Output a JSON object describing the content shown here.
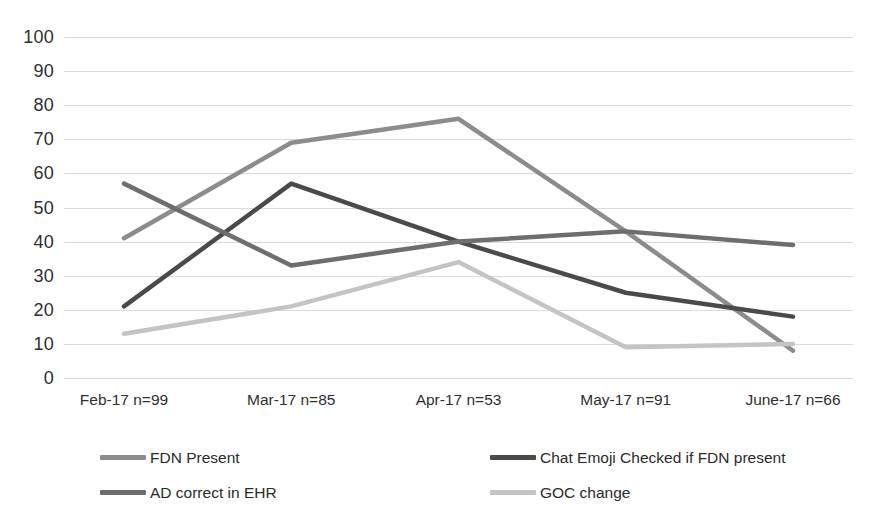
{
  "chart_data": {
    "type": "line",
    "title": "",
    "xlabel": "",
    "ylabel": "",
    "ylim": [
      0,
      100
    ],
    "ytick_step": 10,
    "grid": true,
    "legend_position": "bottom",
    "categories": [
      "Feb-17  n=99",
      "Mar-17  n=85",
      "Apr-17  n=53",
      "May-17 n=91",
      "June-17 n=66"
    ],
    "yticks": [
      "100",
      "90",
      "80",
      "70",
      "60",
      "50",
      "40",
      "30",
      "20",
      "10",
      "0"
    ],
    "ytick_values": [
      100,
      90,
      80,
      70,
      60,
      50,
      40,
      30,
      20,
      10,
      0
    ],
    "series": [
      {
        "name": "FDN Present",
        "color": "#8c8c8c",
        "values": [
          41,
          69,
          76,
          43,
          8
        ]
      },
      {
        "name": "Chat Emoji Checked if FDN present",
        "color": "#4a4a4a",
        "values": [
          21,
          57,
          40,
          25,
          18
        ]
      },
      {
        "name": "AD correct in EHR",
        "color": "#6e6e6e",
        "values": [
          57,
          33,
          40,
          43,
          39
        ]
      },
      {
        "name": "GOC change",
        "color": "#c4c4c4",
        "values": [
          13,
          21,
          34,
          9,
          10
        ]
      }
    ]
  },
  "legend": {
    "items": [
      {
        "label": "FDN Present",
        "color": "#8c8c8c"
      },
      {
        "label": "Chat Emoji Checked if FDN present",
        "color": "#4a4a4a"
      },
      {
        "label": "AD correct in EHR",
        "color": "#6e6e6e"
      },
      {
        "label": "GOC change",
        "color": "#c4c4c4"
      }
    ]
  },
  "colors": {
    "gridline": "#dcdcdc",
    "text": "#2b2b2b",
    "background": "#ffffff"
  }
}
